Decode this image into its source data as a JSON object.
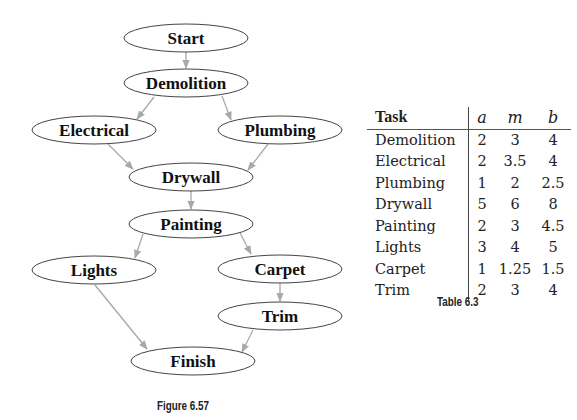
{
  "figure": {
    "caption": "Figure 6.57",
    "nodes": [
      {
        "id": "start",
        "label": "Start",
        "cx": 186,
        "cy": 38,
        "rx": 62,
        "ry": 14
      },
      {
        "id": "demolition",
        "label": "Demolition",
        "cx": 186,
        "cy": 83,
        "rx": 62,
        "ry": 14
      },
      {
        "id": "electrical",
        "label": "Electrical",
        "cx": 94,
        "cy": 130,
        "rx": 62,
        "ry": 14
      },
      {
        "id": "plumbing",
        "label": "Plumbing",
        "cx": 280,
        "cy": 130,
        "rx": 62,
        "ry": 14
      },
      {
        "id": "drywall",
        "label": "Drywall",
        "cx": 191,
        "cy": 177,
        "rx": 62,
        "ry": 14
      },
      {
        "id": "painting",
        "label": "Painting",
        "cx": 191,
        "cy": 224,
        "rx": 62,
        "ry": 14
      },
      {
        "id": "lights",
        "label": "Lights",
        "cx": 94,
        "cy": 270,
        "rx": 62,
        "ry": 14
      },
      {
        "id": "carpet",
        "label": "Carpet",
        "cx": 280,
        "cy": 269,
        "rx": 62,
        "ry": 14
      },
      {
        "id": "trim",
        "label": "Trim",
        "cx": 280,
        "cy": 316,
        "rx": 62,
        "ry": 14
      },
      {
        "id": "finish",
        "label": "Finish",
        "cx": 193,
        "cy": 361,
        "rx": 62,
        "ry": 14
      }
    ],
    "edges": [
      {
        "from": "start",
        "to": "demolition",
        "x1": 186,
        "y1": 52,
        "x2": 186,
        "y2": 68
      },
      {
        "from": "demolition",
        "to": "electrical",
        "x1": 154,
        "y1": 97,
        "x2": 137,
        "y2": 119
      },
      {
        "from": "demolition",
        "to": "plumbing",
        "x1": 222,
        "y1": 96,
        "x2": 231,
        "y2": 120
      },
      {
        "from": "electrical",
        "to": "drywall",
        "x1": 108,
        "y1": 144,
        "x2": 133,
        "y2": 169
      },
      {
        "from": "plumbing",
        "to": "drywall",
        "x1": 268,
        "y1": 144,
        "x2": 248,
        "y2": 170
      },
      {
        "from": "drywall",
        "to": "painting",
        "x1": 191,
        "y1": 191,
        "x2": 191,
        "y2": 209
      },
      {
        "from": "painting",
        "to": "lights",
        "x1": 143,
        "y1": 234,
        "x2": 135,
        "y2": 258
      },
      {
        "from": "painting",
        "to": "carpet",
        "x1": 240,
        "y1": 233,
        "x2": 251,
        "y2": 254
      },
      {
        "from": "carpet",
        "to": "trim",
        "x1": 280,
        "y1": 283,
        "x2": 280,
        "y2": 301
      },
      {
        "from": "lights",
        "to": "finish",
        "x1": 95,
        "y1": 285,
        "x2": 147,
        "y2": 349
      },
      {
        "from": "trim",
        "to": "finish",
        "x1": 253,
        "y1": 330,
        "x2": 242,
        "y2": 352
      }
    ],
    "edge_color": "#a8a8a8",
    "node_stroke": "#444444"
  },
  "table": {
    "caption": "Table 6.3",
    "headers": [
      "Task",
      "a",
      "m",
      "b"
    ],
    "rows": [
      [
        "Demolition",
        "2",
        "3",
        "4"
      ],
      [
        "Electrical",
        "2",
        "3.5",
        "4"
      ],
      [
        "Plumbing",
        "1",
        "2",
        "2.5"
      ],
      [
        "Drywall",
        "5",
        "6",
        "8"
      ],
      [
        "Painting",
        "2",
        "3",
        "4.5"
      ],
      [
        "Lights",
        "3",
        "4",
        "5"
      ],
      [
        "Carpet",
        "1",
        "1.25",
        "1.5"
      ],
      [
        "Trim",
        "2",
        "3",
        "4"
      ]
    ]
  }
}
